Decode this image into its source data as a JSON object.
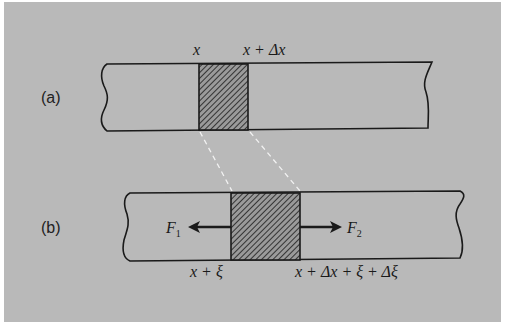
{
  "figure": {
    "panel_a": {
      "label": "(a)",
      "left_position_label": "x",
      "right_position_label_parts": [
        "x",
        " + Δ",
        "x"
      ],
      "right_position_label": "x + Δx"
    },
    "panel_b": {
      "label": "(b)",
      "force_left": {
        "symbol": "F",
        "subscript": "1",
        "direction": "left"
      },
      "force_right": {
        "symbol": "F",
        "subscript": "2",
        "direction": "right"
      },
      "left_position_label": "x + ξ",
      "right_position_label": "x + Δx + ξ + Δξ"
    },
    "connector_style": "dashed-white",
    "element_fill": "diagonal-hatch",
    "colors": {
      "background": "#b9b9b9",
      "line": "#1a1a1a",
      "dashed_connector": "#f2f2f2",
      "page": "#ffffff"
    }
  }
}
